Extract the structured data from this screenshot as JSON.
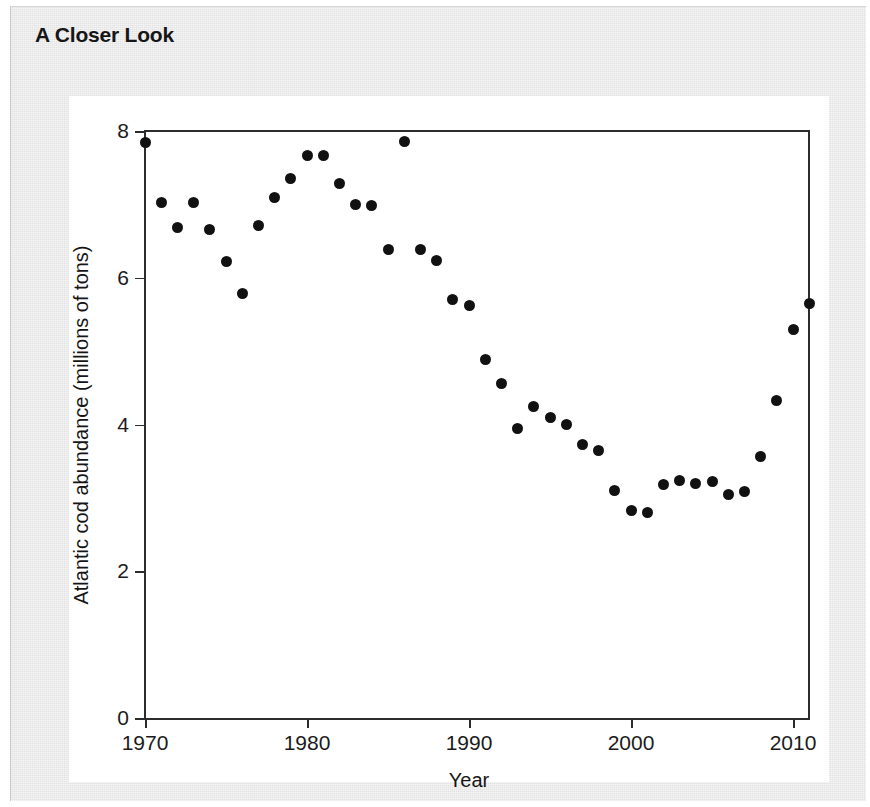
{
  "panel": {
    "title": "A Closer Look",
    "background_color": "#e9e9e9",
    "card_color": "#ffffff"
  },
  "chart_data": {
    "type": "scatter",
    "title": "",
    "xlabel": "Year",
    "ylabel": "Atlantic cod abundance (millions of tons)",
    "xlim": [
      1970,
      2011.6
    ],
    "ylim": [
      0,
      8
    ],
    "xticks": [
      1970,
      1980,
      1990,
      2000,
      2010
    ],
    "xtick_labels": [
      "1970",
      "1980",
      "1990",
      "2000",
      "2010"
    ],
    "yticks": [
      0,
      2,
      4,
      6,
      8
    ],
    "ytick_labels": [
      "0",
      "2",
      "4",
      "6",
      "8"
    ],
    "grid": false,
    "legend": false,
    "marker_color": "#111111",
    "axis_color": "#2c2c2c",
    "x": [
      1970,
      1971,
      1972,
      1973,
      1974,
      1975,
      1976,
      1977,
      1978,
      1979,
      1980,
      1981,
      1982,
      1983,
      1984,
      1985,
      1986,
      1987,
      1988,
      1989,
      1990,
      1991,
      1992,
      1993,
      1994,
      1995,
      1996,
      1997,
      1998,
      1999,
      2000,
      2001,
      2002,
      2003,
      2004,
      2005,
      2006,
      2007,
      2008,
      2009,
      2010,
      2011
    ],
    "y": [
      7.85,
      7.03,
      6.68,
      7.02,
      6.66,
      6.22,
      5.79,
      6.71,
      7.1,
      7.35,
      7.67,
      7.66,
      7.28,
      7.0,
      6.98,
      6.38,
      7.86,
      6.38,
      6.24,
      5.7,
      5.62,
      4.88,
      4.56,
      3.94,
      4.25,
      4.1,
      4.0,
      3.73,
      3.65,
      3.1,
      2.83,
      2.8,
      3.18,
      3.24,
      3.2,
      3.22,
      3.05,
      3.09,
      3.57,
      4.33,
      5.3,
      5.65
    ]
  }
}
